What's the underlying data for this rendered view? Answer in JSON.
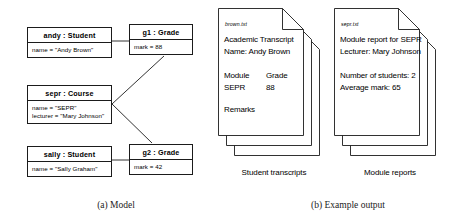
{
  "figure": {
    "caption_a": "(a) Model",
    "caption_b": "(b) Example output"
  },
  "model": {
    "objects": [
      {
        "id": "andy",
        "title": "andy : Student",
        "attributes": [
          "name = \"Andy Brown\""
        ]
      },
      {
        "id": "g1",
        "title": "g1 : Grade",
        "attributes": [
          "mark = 88"
        ]
      },
      {
        "id": "sepr",
        "title": "sepr : Course",
        "attributes": [
          "name = \"SEPR\"",
          "lecturer = \"Mary Johnson\""
        ]
      },
      {
        "id": "sally",
        "title": "sally : Student",
        "attributes": [
          "name = \"Sally Graham\""
        ]
      },
      {
        "id": "g2",
        "title": "g2 : Grade",
        "attributes": [
          "mark = 42"
        ]
      }
    ],
    "links": [
      {
        "from": "andy",
        "to": "g1"
      },
      {
        "from": "sally",
        "to": "g2"
      },
      {
        "from": "sepr",
        "to": "g1"
      },
      {
        "from": "sepr",
        "to": "g2"
      }
    ]
  },
  "output": {
    "stacks": [
      {
        "id": "student-transcripts",
        "caption": "Student transcripts",
        "filename": "brown.txt",
        "lines": {
          "l1": "Academic  Transcript",
          "l2": "Name:  Andy Brown",
          "l3": "Module",
          "l3b": "Grade",
          "l4": "SEPR",
          "l4b": "88",
          "l5": "Remarks"
        }
      },
      {
        "id": "module-reports",
        "caption": "Module reports",
        "filename": "sepr.txt",
        "lines": {
          "l1": "Module report for SEPR",
          "l2": "Lecturer: Mary Johnson",
          "l3": "Number of students: 2",
          "l4": "Average mark: 65"
        }
      }
    ]
  },
  "colors": {
    "stroke": "#1b1b1b",
    "background": "#ffffff"
  }
}
